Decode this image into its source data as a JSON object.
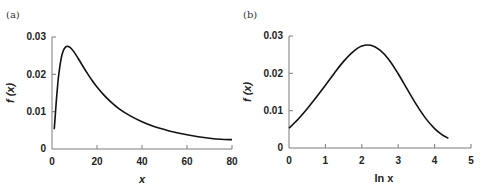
{
  "panels": [
    {
      "label": "(a)"
    },
    {
      "label": "(b)"
    }
  ],
  "chart_data": [
    {
      "type": "line",
      "panel": "(a)",
      "title": "",
      "xlabel": "x",
      "ylabel": "f (x)",
      "xlim": [
        0,
        80
      ],
      "ylim": [
        0,
        0.03
      ],
      "xticks": [
        "0",
        "20",
        "40",
        "60",
        "80"
      ],
      "yticks": [
        "0",
        "0.01",
        "0.02",
        "0.03"
      ],
      "grid": false,
      "legend": null,
      "series": [
        {
          "name": "f(x)",
          "x": [
            1,
            1.5,
            2,
            2.5,
            3,
            4,
            5,
            6,
            7,
            8,
            9,
            10,
            12,
            14,
            16,
            18,
            20,
            23,
            26,
            30,
            35,
            40,
            45,
            50,
            55,
            60,
            65,
            70,
            75,
            80
          ],
          "y": [
            0.0053,
            0.0094,
            0.0135,
            0.017,
            0.0199,
            0.024,
            0.0263,
            0.0273,
            0.0275,
            0.0272,
            0.0266,
            0.0258,
            0.0239,
            0.0219,
            0.02,
            0.0182,
            0.0166,
            0.0145,
            0.0127,
            0.0107,
            0.0088,
            0.0073,
            0.0061,
            0.0052,
            0.0044,
            0.0038,
            0.0033,
            0.0029,
            0.0026,
            0.0025
          ]
        }
      ]
    },
    {
      "type": "line",
      "panel": "(b)",
      "title": "",
      "xlabel": "ln x",
      "ylabel": "f (x)",
      "xlim": [
        0,
        5
      ],
      "ylim": [
        0,
        0.03
      ],
      "xticks": [
        "0",
        "1",
        "2",
        "3",
        "4",
        "5"
      ],
      "yticks": [
        "0",
        "0.01",
        "0.02",
        "0.03"
      ],
      "grid": false,
      "legend": null,
      "series": [
        {
          "name": "f(x)",
          "x": [
            0,
            0.25,
            0.5,
            0.75,
            1.0,
            1.25,
            1.5,
            1.75,
            2.0,
            2.25,
            2.5,
            2.75,
            3.0,
            3.25,
            3.5,
            3.75,
            4.0,
            4.2,
            4.38
          ],
          "y": [
            0.0053,
            0.0077,
            0.0105,
            0.0136,
            0.0168,
            0.0201,
            0.0232,
            0.0257,
            0.0273,
            0.0275,
            0.0262,
            0.0236,
            0.0199,
            0.0157,
            0.0116,
            0.008,
            0.0052,
            0.0036,
            0.0026
          ]
        }
      ]
    }
  ]
}
